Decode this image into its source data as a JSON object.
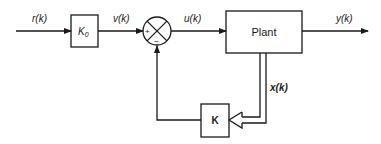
{
  "diagram": {
    "type": "block-diagram",
    "colors": {
      "stroke": "#1a1a1a",
      "background": "#ffffff"
    },
    "signals": {
      "reference": "r(k)",
      "scaled_reference": "v(k)",
      "control": "u(k)",
      "output": "y(k)",
      "state": "x(k)"
    },
    "blocks": {
      "prefilter": {
        "label_main": "K",
        "label_sub": "0"
      },
      "plant": {
        "label": "Plant"
      },
      "feedback_gain": {
        "label": "K"
      }
    },
    "summing_junction": {
      "plus_sign": "+",
      "minus_sign": "−"
    }
  }
}
